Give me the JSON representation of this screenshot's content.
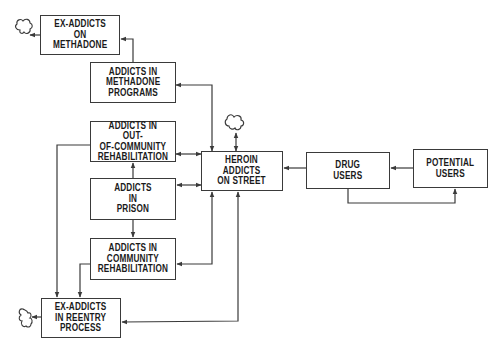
{
  "diagram": {
    "type": "flow diagram",
    "nodes": {
      "ex_addicts_methadone": "EX-ADDICTS\nON\nMETHADONE",
      "methadone_programs": "ADDICTS IN\nMETHADONE\nPROGRAMS",
      "out_of_community_rehab": "ADDICTS IN OUT-\nOF-COMMUNITY\nREHABILITATION",
      "prison": "ADDICTS\nIN\nPRISON",
      "community_rehab": "ADDICTS IN\nCOMMUNITY\nREHABILITATION",
      "ex_addicts_reentry": "EX-ADDICTS\nIN REENTRY\nPROCESS",
      "heroin_street": "HEROIN\nADDICTS\nON STREET",
      "drug_users": "DRUG\nUSERS",
      "potential_users": "POTENTIAL\nUSERS"
    },
    "sinks": [
      "cloud-from-ex-addicts-on-methadone",
      "cloud-from-heroin-addicts-on-street",
      "cloud-from-ex-addicts-in-reentry"
    ],
    "edges": [
      {
        "from": "potential_users",
        "to": "drug_users"
      },
      {
        "from": "drug_users",
        "to": "potential_users"
      },
      {
        "from": "drug_users",
        "to": "heroin_street"
      },
      {
        "from": "heroin_street",
        "to": "methadone_programs",
        "bidirectional": true
      },
      {
        "from": "heroin_street",
        "to": "out_of_community_rehab",
        "bidirectional": true
      },
      {
        "from": "heroin_street",
        "to": "prison",
        "bidirectional": true
      },
      {
        "from": "heroin_street",
        "to": "community_rehab",
        "bidirectional": true
      },
      {
        "from": "ex_addicts_reentry",
        "to": "heroin_street"
      },
      {
        "from": "methadone_programs",
        "to": "ex_addicts_methadone"
      },
      {
        "from": "prison",
        "to": "out_of_community_rehab"
      },
      {
        "from": "prison",
        "to": "community_rehab"
      },
      {
        "from": "out_of_community_rehab",
        "to": "ex_addicts_reentry"
      },
      {
        "from": "community_rehab",
        "to": "ex_addicts_reentry"
      },
      {
        "from": "heroin_street",
        "to": "cloud",
        "bidirectional": true
      },
      {
        "from": "ex_addicts_methadone",
        "to": "cloud"
      },
      {
        "from": "ex_addicts_reentry",
        "to": "cloud"
      }
    ]
  }
}
